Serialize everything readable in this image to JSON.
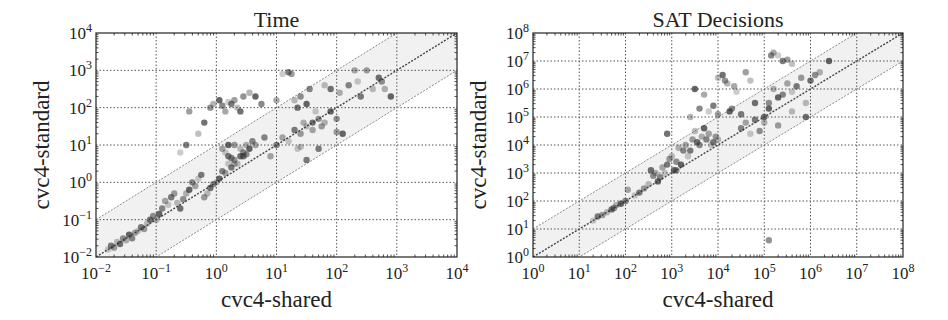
{
  "chart_data": [
    {
      "type": "scatter",
      "title": "Time",
      "xlabel": "cvc4-shared",
      "ylabel": "cvc4-standard",
      "xscale": "log",
      "yscale": "log",
      "xlim_log10": [
        -2,
        4
      ],
      "ylim_log10": [
        -2,
        4
      ],
      "xticks": [
        "10^-2",
        "10^-1",
        "10^0",
        "10^1",
        "10^2",
        "10^3",
        "10^4"
      ],
      "yticks": [
        "10^-2",
        "10^-1",
        "10^0",
        "10^1",
        "10^2",
        "10^3",
        "10^4"
      ],
      "grid": true,
      "reference_lines": [
        "y = x",
        "y = 10x",
        "y = x/10"
      ],
      "shaded_band": "between y = x/10 and y = 10x",
      "frame": {
        "left": 96,
        "top": 33,
        "right": 457,
        "bottom": 257
      },
      "points_log10": [
        [
          -1.8,
          -1.8
        ],
        [
          -1.75,
          -1.7
        ],
        [
          -1.7,
          -1.75
        ],
        [
          -1.65,
          -1.6
        ],
        [
          -1.6,
          -1.65
        ],
        [
          -1.55,
          -1.5
        ],
        [
          -1.5,
          -1.55
        ],
        [
          -1.45,
          -1.4
        ],
        [
          -1.4,
          -1.5
        ],
        [
          -1.35,
          -1.35
        ],
        [
          -1.3,
          -1.3
        ],
        [
          -1.25,
          -1.2
        ],
        [
          -1.2,
          -1.25
        ],
        [
          -1.15,
          -1.1
        ],
        [
          -1.1,
          -1.0
        ],
        [
          -1.05,
          -0.9
        ],
        [
          -1.0,
          -1.0
        ],
        [
          -0.95,
          -0.85
        ],
        [
          -0.9,
          -0.7
        ],
        [
          -0.85,
          -0.5
        ],
        [
          -0.8,
          -0.6
        ],
        [
          -0.75,
          -0.4
        ],
        [
          -0.7,
          -0.3
        ],
        [
          -0.65,
          -0.55
        ],
        [
          -0.6,
          -0.7
        ],
        [
          -0.55,
          -0.45
        ],
        [
          -0.5,
          -0.3
        ],
        [
          -0.45,
          -0.2
        ],
        [
          -0.4,
          0.0
        ],
        [
          -0.35,
          -0.1
        ],
        [
          -0.3,
          0.1
        ],
        [
          -0.25,
          0.2
        ],
        [
          -0.2,
          -0.4
        ],
        [
          -0.15,
          -0.3
        ],
        [
          -0.1,
          -0.15
        ],
        [
          -0.05,
          -0.05
        ],
        [
          0.0,
          0.0
        ],
        [
          0.05,
          0.1
        ],
        [
          0.1,
          0.3
        ],
        [
          0.15,
          0.25
        ],
        [
          0.2,
          0.5
        ],
        [
          0.25,
          0.4
        ],
        [
          0.3,
          0.6
        ],
        [
          0.35,
          0.5
        ],
        [
          0.4,
          0.7
        ],
        [
          0.45,
          0.8
        ],
        [
          0.5,
          1.0
        ],
        [
          0.55,
          0.9
        ],
        [
          0.6,
          1.1
        ],
        [
          0.65,
          1.0
        ],
        [
          -0.6,
          0.8
        ],
        [
          -0.5,
          1.0
        ],
        [
          -0.45,
          1.9
        ],
        [
          -0.3,
          1.3
        ],
        [
          -0.2,
          1.6
        ],
        [
          -0.1,
          2.0
        ],
        [
          -0.05,
          2.1
        ],
        [
          0.05,
          2.2
        ],
        [
          0.1,
          2.05
        ],
        [
          0.15,
          1.9
        ],
        [
          0.2,
          2.15
        ],
        [
          0.25,
          2.1
        ],
        [
          0.3,
          2.2
        ],
        [
          0.35,
          2.0
        ],
        [
          0.4,
          1.9
        ],
        [
          0.45,
          2.3
        ],
        [
          0.55,
          2.4
        ],
        [
          0.65,
          2.3
        ],
        [
          0.75,
          2.1
        ],
        [
          0.1,
          0.9
        ],
        [
          0.15,
          0.8
        ],
        [
          0.2,
          0.7
        ],
        [
          0.3,
          1.0
        ],
        [
          0.4,
          0.9
        ],
        [
          0.45,
          0.7
        ],
        [
          0.5,
          0.75
        ],
        [
          0.3,
          0.5
        ],
        [
          0.2,
          1.0
        ],
        [
          0.25,
          0.65
        ],
        [
          1.0,
          2.2
        ],
        [
          1.1,
          2.9
        ],
        [
          1.2,
          2.95
        ],
        [
          1.25,
          2.9
        ],
        [
          1.3,
          2.2
        ],
        [
          1.35,
          2.0
        ],
        [
          1.4,
          2.3
        ],
        [
          1.45,
          1.6
        ],
        [
          1.5,
          2.1
        ],
        [
          1.55,
          2.5
        ],
        [
          1.6,
          1.4
        ],
        [
          1.65,
          1.9
        ],
        [
          1.7,
          0.9
        ],
        [
          1.75,
          1.5
        ],
        [
          1.8,
          2.6
        ],
        [
          1.9,
          2.5
        ],
        [
          2.0,
          1.7
        ],
        [
          2.05,
          2.4
        ],
        [
          2.1,
          1.3
        ],
        [
          2.2,
          2.6
        ],
        [
          2.3,
          3.0
        ],
        [
          2.35,
          2.7
        ],
        [
          2.4,
          2.3
        ],
        [
          2.5,
          3.0
        ],
        [
          2.6,
          2.5
        ],
        [
          2.7,
          2.8
        ],
        [
          2.75,
          2.7
        ],
        [
          2.8,
          2.5
        ],
        [
          2.9,
          2.3
        ],
        [
          1.0,
          1.0
        ],
        [
          1.1,
          1.2
        ],
        [
          1.2,
          1.1
        ],
        [
          1.3,
          1.4
        ],
        [
          1.4,
          1.3
        ],
        [
          1.5,
          1.5
        ],
        [
          1.6,
          1.6
        ],
        [
          1.7,
          1.7
        ],
        [
          1.8,
          1.6
        ],
        [
          1.9,
          1.9
        ],
        [
          0.8,
          1.2
        ],
        [
          0.9,
          0.7
        ],
        [
          1.35,
          0.9
        ],
        [
          1.5,
          0.6
        ],
        [
          2.0,
          1.35
        ],
        [
          1.4,
          0.95
        ]
      ]
    },
    {
      "type": "scatter",
      "title": "SAT Decisions",
      "xlabel": "cvc4-shared",
      "ylabel": "cvc4-standard",
      "xscale": "log",
      "yscale": "log",
      "xlim_log10": [
        0,
        8
      ],
      "ylim_log10": [
        0,
        8
      ],
      "xticks": [
        "10^0",
        "10^1",
        "10^2",
        "10^3",
        "10^4",
        "10^5",
        "10^6",
        "10^7",
        "10^8"
      ],
      "yticks": [
        "10^0",
        "10^1",
        "10^2",
        "10^3",
        "10^4",
        "10^5",
        "10^6",
        "10^7",
        "10^8"
      ],
      "grid": true,
      "reference_lines": [
        "y = x",
        "y = 10x",
        "y = x/10"
      ],
      "shaded_band": "between y = x/10 and y = 10x",
      "frame": {
        "left": 533,
        "top": 33,
        "right": 903,
        "bottom": 257
      },
      "points_log10": [
        [
          1.3,
          1.3
        ],
        [
          1.4,
          1.45
        ],
        [
          1.5,
          1.5
        ],
        [
          1.6,
          1.6
        ],
        [
          1.7,
          1.7
        ],
        [
          1.75,
          1.75
        ],
        [
          1.8,
          1.85
        ],
        [
          1.9,
          1.9
        ],
        [
          2.0,
          2.0
        ],
        [
          2.05,
          2.4
        ],
        [
          2.2,
          2.2
        ],
        [
          2.3,
          2.3
        ],
        [
          2.4,
          2.45
        ],
        [
          2.5,
          2.6
        ],
        [
          2.55,
          3.1
        ],
        [
          2.6,
          2.9
        ],
        [
          2.65,
          3.0
        ],
        [
          2.7,
          2.7
        ],
        [
          2.75,
          2.85
        ],
        [
          2.8,
          3.2
        ],
        [
          2.85,
          3.0
        ],
        [
          2.9,
          3.3
        ],
        [
          2.95,
          3.5
        ],
        [
          3.0,
          3.6
        ],
        [
          3.05,
          3.1
        ],
        [
          3.1,
          3.4
        ],
        [
          3.15,
          3.9
        ],
        [
          3.2,
          3.3
        ],
        [
          3.25,
          3.8
        ],
        [
          3.3,
          4.0
        ],
        [
          3.35,
          3.6
        ],
        [
          3.4,
          3.8
        ],
        [
          3.45,
          4.2
        ],
        [
          3.5,
          4.5
        ],
        [
          3.55,
          4.1
        ],
        [
          3.6,
          4.0
        ],
        [
          3.65,
          4.3
        ],
        [
          3.7,
          4.6
        ],
        [
          3.75,
          4.2
        ],
        [
          3.8,
          4.4
        ],
        [
          3.85,
          4.0
        ],
        [
          3.9,
          4.1
        ],
        [
          3.95,
          4.3
        ],
        [
          4.0,
          4.2
        ],
        [
          2.9,
          4.4
        ],
        [
          3.1,
          3.1
        ],
        [
          3.4,
          5.0
        ],
        [
          3.5,
          6.0
        ],
        [
          3.6,
          5.3
        ],
        [
          3.7,
          5.8
        ],
        [
          3.8,
          5.2
        ],
        [
          3.9,
          5.4
        ],
        [
          4.0,
          5.1
        ],
        [
          4.0,
          6.4
        ],
        [
          4.1,
          6.5
        ],
        [
          4.15,
          6.3
        ],
        [
          4.2,
          6.2
        ],
        [
          4.25,
          5.2
        ],
        [
          4.3,
          5.3
        ],
        [
          4.35,
          6.1
        ],
        [
          4.4,
          5.9
        ],
        [
          4.5,
          5.1
        ],
        [
          4.6,
          6.6
        ],
        [
          4.7,
          6.3
        ],
        [
          4.8,
          5.5
        ],
        [
          4.9,
          4.5
        ],
        [
          5.0,
          4.8
        ],
        [
          5.1,
          5.3
        ],
        [
          5.15,
          7.2
        ],
        [
          5.2,
          7.3
        ],
        [
          5.3,
          7.2
        ],
        [
          5.4,
          7.0
        ],
        [
          5.5,
          7.05
        ],
        [
          5.6,
          6.9
        ],
        [
          5.0,
          5.0
        ],
        [
          5.1,
          5.5
        ],
        [
          5.2,
          6.0
        ],
        [
          5.3,
          5.7
        ],
        [
          5.4,
          5.8
        ],
        [
          5.5,
          6.2
        ],
        [
          5.6,
          5.9
        ],
        [
          5.7,
          6.1
        ],
        [
          5.8,
          6.4
        ],
        [
          5.9,
          5.5
        ],
        [
          6.0,
          6.3
        ],
        [
          6.1,
          6.5
        ],
        [
          6.2,
          6.6
        ],
        [
          6.4,
          7.0
        ],
        [
          4.5,
          4.6
        ],
        [
          4.6,
          4.8
        ],
        [
          4.7,
          4.4
        ],
        [
          4.8,
          4.9
        ],
        [
          5.3,
          4.7
        ],
        [
          5.6,
          5.2
        ],
        [
          5.9,
          5.0
        ],
        [
          5.1,
          0.6
        ]
      ]
    }
  ]
}
